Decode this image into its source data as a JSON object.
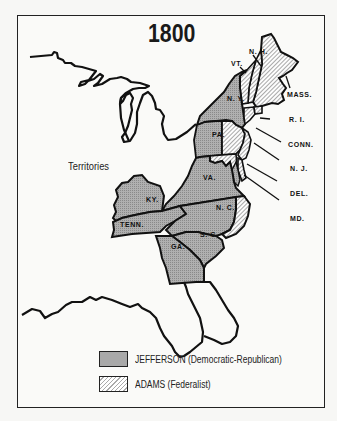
{
  "map": {
    "title": "1800",
    "region_label": "Territories",
    "colors": {
      "jefferson_fill": "#a9a9a9",
      "adams_fill": "hatched #aaaaaa on #ffffff",
      "outline": "#111111",
      "background": "#fafaf8"
    },
    "states": [
      {
        "abbr": "N. H.",
        "party": "adams"
      },
      {
        "abbr": "VT.",
        "party": "adams"
      },
      {
        "abbr": "MASS.",
        "party": "adams"
      },
      {
        "abbr": "N. Y.",
        "party": "jefferson"
      },
      {
        "abbr": "R. I.",
        "party": "adams"
      },
      {
        "abbr": "CONN.",
        "party": "adams"
      },
      {
        "abbr": "PA.",
        "party": "split"
      },
      {
        "abbr": "N. J.",
        "party": "adams"
      },
      {
        "abbr": "DEL.",
        "party": "adams"
      },
      {
        "abbr": "MD.",
        "party": "split"
      },
      {
        "abbr": "VA.",
        "party": "jefferson"
      },
      {
        "abbr": "KY.",
        "party": "jefferson"
      },
      {
        "abbr": "TENN.",
        "party": "jefferson"
      },
      {
        "abbr": "N. C.",
        "party": "split"
      },
      {
        "abbr": "S. C.",
        "party": "jefferson"
      },
      {
        "abbr": "GA.",
        "party": "jefferson"
      }
    ]
  },
  "legend": {
    "items": [
      {
        "label": "JEFFERSON (Democratic-Republican)",
        "pattern": "stipple"
      },
      {
        "label": "ADAMS (Federalist)",
        "pattern": "hatch"
      }
    ]
  }
}
